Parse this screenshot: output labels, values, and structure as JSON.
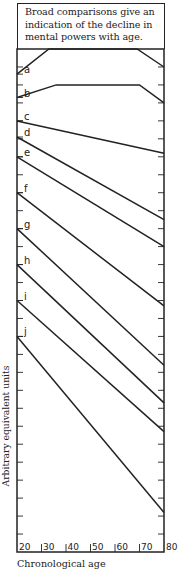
{
  "chart_data": {
    "type": "line",
    "title": "Broad comparisons give an indication of the decline in mental powers with age.",
    "xlabel": "Chronological age",
    "ylabel": "Arbitrary equivalent units",
    "x_ticks": [
      20,
      30,
      40,
      50,
      60,
      70,
      80
    ],
    "xlim": [
      20,
      80
    ],
    "ylim": [
      0,
      28
    ],
    "y_tick_step": 1,
    "grid": false,
    "legend": "inline letter labels at left edge",
    "series": [
      {
        "name": "a",
        "x": [
          20,
          33,
          69,
          80
        ],
        "y": [
          26.6,
          28.0,
          28.0,
          27.0
        ]
      },
      {
        "name": "b",
        "x": [
          20,
          36,
          70,
          80
        ],
        "y": [
          25.3,
          26.0,
          26.0,
          25.0
        ]
      },
      {
        "name": "c",
        "x": [
          20,
          80
        ],
        "y": [
          24.0,
          22.2
        ]
      },
      {
        "name": "d",
        "x": [
          20,
          80
        ],
        "y": [
          23.1,
          18.5
        ]
      },
      {
        "name": "e",
        "x": [
          20,
          80
        ],
        "y": [
          22.0,
          17.0
        ]
      },
      {
        "name": "f",
        "x": [
          20,
          80
        ],
        "y": [
          20.0,
          13.7
        ]
      },
      {
        "name": "g",
        "x": [
          20,
          80
        ],
        "y": [
          18.0,
          10.4
        ]
      },
      {
        "name": "h",
        "x": [
          20,
          80
        ],
        "y": [
          16.0,
          8.3
        ]
      },
      {
        "name": "i",
        "x": [
          20,
          80
        ],
        "y": [
          14.0,
          6.7
        ]
      },
      {
        "name": "j",
        "x": [
          20,
          80
        ],
        "y": [
          12.0,
          2.2
        ]
      }
    ]
  },
  "title_text": "Broad comparisons give an indication of the decline in mental powers with age.",
  "title_lines": [
    "Broad comparisons give an",
    "indication of the decline in",
    "mental powers with age."
  ],
  "xlabel": "Chronological age",
  "ylabel": "Arbitrary equivalent units",
  "colors": {
    "line": "#222222",
    "background": "#ffffff"
  }
}
